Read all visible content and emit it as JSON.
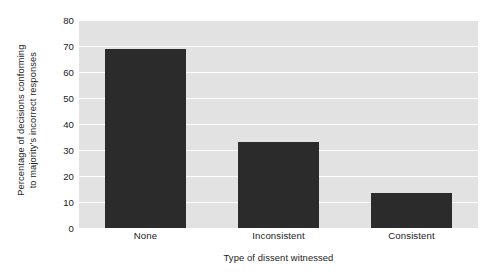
{
  "chart_data": {
    "type": "bar",
    "title": "",
    "categories": [
      "None",
      "Inconsistent",
      "Consistent"
    ],
    "values": [
      69,
      33,
      13.5
    ],
    "xlabel": "Type of dissent witnessed",
    "ylabel_line1": "Percentage of decisions conforming",
    "ylabel_line2": "to majority's incorrect responses",
    "ylim": [
      0,
      80
    ],
    "yticks": [
      0,
      10,
      20,
      30,
      40,
      50,
      60,
      70,
      80
    ],
    "ytick_labels": [
      "0",
      "10",
      "20",
      "30",
      "40",
      "50",
      "60",
      "70",
      "80"
    ],
    "grid": true,
    "legend": "none",
    "colors": {
      "bar": "#2b2b2b",
      "plot_background": "#e2e2e2",
      "gridline": "#ffffff",
      "page_background": "#ffffff",
      "text": "#1b1b1b"
    }
  }
}
